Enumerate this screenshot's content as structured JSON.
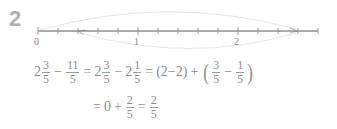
{
  "problem": {
    "number": "2"
  },
  "number_line": {
    "labels": [
      "0",
      "1",
      "2"
    ],
    "ticks_per_unit": 5,
    "start": 0,
    "end": 2.8,
    "jump_forward": {
      "from": 0,
      "to": 2.6
    },
    "jump_back": {
      "from": 2.6,
      "to": 0.4
    },
    "line_color": "#555555",
    "arc_color": "#dddddd"
  },
  "equation": {
    "line1": {
      "term1_whole": "2",
      "term1_num": "3",
      "term1_den": "5",
      "op1": "−",
      "term2_num": "11",
      "term2_den": "5",
      "eq1": "=",
      "term3_whole": "2",
      "term3_num": "3",
      "term3_den": "5",
      "op2": "−",
      "term4_whole": "2",
      "term4_num": "1",
      "term4_den": "5",
      "eq2": "=",
      "group1": "(2−2)",
      "op3": "+",
      "lparen": "(",
      "term5_num": "3",
      "term5_den": "5",
      "op4": "−",
      "term6_num": "1",
      "term6_den": "5",
      "rparen": ")"
    },
    "line2": {
      "eq1": "=",
      "zero": "0",
      "op1": "+",
      "term1_num": "2",
      "term1_den": "5",
      "eq2": "=",
      "term2_num": "2",
      "term2_den": "5"
    }
  }
}
